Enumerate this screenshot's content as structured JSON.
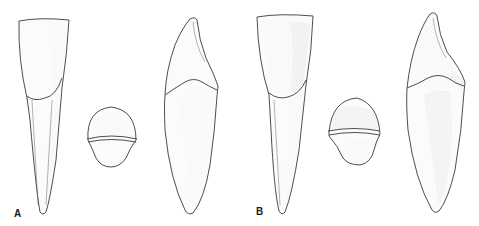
{
  "figure": {
    "panels": [
      {
        "label": "A",
        "views": [
          {
            "name": "labial-view",
            "description": "labial view of incisor crown and root"
          },
          {
            "name": "incisal-view",
            "description": "incisal / cross-section view"
          },
          {
            "name": "proximal-view",
            "description": "proximal view with pointed crown"
          }
        ]
      },
      {
        "label": "B",
        "views": [
          {
            "name": "labial-view",
            "description": "labial view of incisor crown and root (more shaded)"
          },
          {
            "name": "incisal-view",
            "description": "incisal / cross-section view"
          },
          {
            "name": "proximal-view",
            "description": "proximal view with pointed crown"
          }
        ]
      }
    ],
    "colors": {
      "line": "#3a3a3a",
      "background": "#ffffff",
      "shading": "#9a9a9a"
    }
  }
}
